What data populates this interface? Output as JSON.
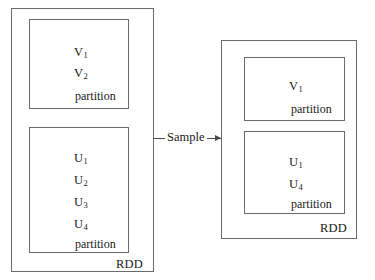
{
  "diagram": {
    "stroke_color": "#6b6b6b",
    "text_color": "#1a1a1a",
    "background": "#ffffff",
    "source": {
      "rdd_label": "RDD",
      "partitions": [
        {
          "elements": [
            {
              "base": "V",
              "sub": "1"
            },
            {
              "base": "V",
              "sub": "2"
            }
          ],
          "partition_label": "partition"
        },
        {
          "elements": [
            {
              "base": "U",
              "sub": "1"
            },
            {
              "base": "U",
              "sub": "2"
            },
            {
              "base": "U",
              "sub": "3"
            },
            {
              "base": "U",
              "sub": "4"
            }
          ],
          "partition_label": "partition"
        }
      ]
    },
    "operation": {
      "label": "Sample",
      "arrow_direction": "right"
    },
    "result": {
      "rdd_label": "RDD",
      "partitions": [
        {
          "elements": [
            {
              "base": "V",
              "sub": "1"
            }
          ],
          "partition_label": "partition"
        },
        {
          "elements": [
            {
              "base": "U",
              "sub": "1"
            },
            {
              "base": "U",
              "sub": "4"
            }
          ],
          "partition_label": "partition"
        }
      ]
    }
  }
}
